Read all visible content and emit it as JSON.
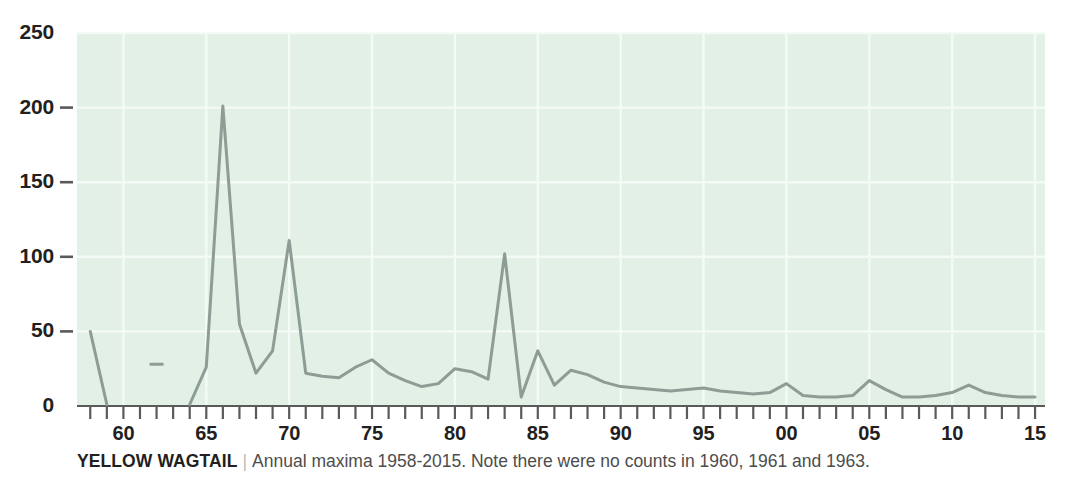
{
  "caption": {
    "species": "YELLOW WAGTAIL",
    "separator": "|",
    "description": "Annual maxima 1958-2015. Note there were no counts in 1960, 1961 and 1963."
  },
  "colors": {
    "plot_background": "#e2f0e6",
    "gridline": "#f4faf6",
    "line": "#8d9c95",
    "axis": "#5a5a5a",
    "tick_label": "#231f20",
    "caption_text": "#4d4d4d",
    "page_background": "#ffffff"
  },
  "chart_data": {
    "type": "line",
    "title": "",
    "xlabel": "",
    "ylabel": "",
    "xlim": [
      1957.2,
      2015.6
    ],
    "ylim": [
      0,
      250
    ],
    "grid": true,
    "legend": "none",
    "yticks": [
      0,
      50,
      100,
      150,
      200,
      250
    ],
    "ytick_labels": [
      "0",
      "50",
      "100",
      "150",
      "200",
      "250"
    ],
    "xticks": [
      1960,
      1965,
      1970,
      1975,
      1980,
      1985,
      1990,
      1995,
      2000,
      2005,
      2010,
      2015
    ],
    "xtick_labels": [
      "60",
      "65",
      "70",
      "75",
      "80",
      "85",
      "90",
      "95",
      "00",
      "05",
      "10",
      "15"
    ],
    "xtick_minor_start": 1958,
    "xtick_minor_end": 2015,
    "missing_years": [
      1960,
      1961,
      1963
    ],
    "x": [
      1958,
      1959,
      1962,
      1964,
      1965,
      1966,
      1967,
      1968,
      1969,
      1970,
      1971,
      1972,
      1973,
      1974,
      1975,
      1976,
      1977,
      1978,
      1979,
      1980,
      1981,
      1982,
      1983,
      1984,
      1985,
      1986,
      1987,
      1988,
      1989,
      1990,
      1991,
      1992,
      1993,
      1994,
      1995,
      1996,
      1997,
      1998,
      1999,
      2000,
      2001,
      2002,
      2003,
      2004,
      2005,
      2006,
      2007,
      2008,
      2009,
      2010,
      2011,
      2012,
      2013,
      2014,
      2015
    ],
    "values": [
      50,
      1,
      28,
      1,
      26,
      201,
      55,
      22,
      37,
      111,
      22,
      20,
      19,
      26,
      31,
      22,
      17,
      13,
      15,
      25,
      23,
      18,
      102,
      6,
      37,
      14,
      24,
      21,
      16,
      13,
      12,
      11,
      10,
      11,
      12,
      10,
      9,
      8,
      9,
      15,
      7,
      6,
      6,
      7,
      17,
      11,
      6,
      6,
      7,
      9,
      14,
      9,
      7,
      6,
      6
    ],
    "series_name": "Yellow Wagtail annual maxima",
    "annotations": [
      {
        "year": 1966,
        "value": 201,
        "note": "highest annual maximum"
      },
      {
        "year": 1970,
        "value": 111,
        "note": "secondary peak"
      },
      {
        "year": 1982,
        "value": 102,
        "note": "late peak"
      }
    ]
  }
}
